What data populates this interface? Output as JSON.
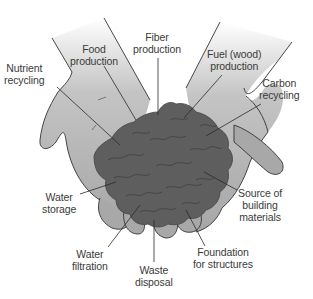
{
  "diagram": {
    "colors": {
      "hand_fill": "#a8a8a8",
      "hand_fill_top": "#e6e6e6",
      "hand_outline": "#333333",
      "soil_fill": "#5e5e5e",
      "soil_texture": "#3f3f3f",
      "leader_line": "#2b2b2b",
      "label_text": "#3a3a3a",
      "background": "#ffffff"
    },
    "labels": [
      {
        "id": "nutrient-recycling",
        "line1": "Nutrient",
        "line2": "recycling"
      },
      {
        "id": "food-production",
        "line1": "Food",
        "line2": "production"
      },
      {
        "id": "fiber-production",
        "line1": "Fiber",
        "line2": "production"
      },
      {
        "id": "fuel-production",
        "line1": "Fuel (wood)",
        "line2": "production"
      },
      {
        "id": "carbon-recycling",
        "line1": "Carbon",
        "line2": "recycling"
      },
      {
        "id": "water-storage",
        "line1": "Water",
        "line2": "storage"
      },
      {
        "id": "source-building-materials",
        "line1": "Source of",
        "line2": "building",
        "line3": "materials"
      },
      {
        "id": "water-filtration",
        "line1": "Water",
        "line2": "filtration"
      },
      {
        "id": "waste-disposal",
        "line1": "Waste",
        "line2": "disposal"
      },
      {
        "id": "foundation-structures",
        "line1": "Foundation",
        "line2": "for structures"
      }
    ]
  }
}
